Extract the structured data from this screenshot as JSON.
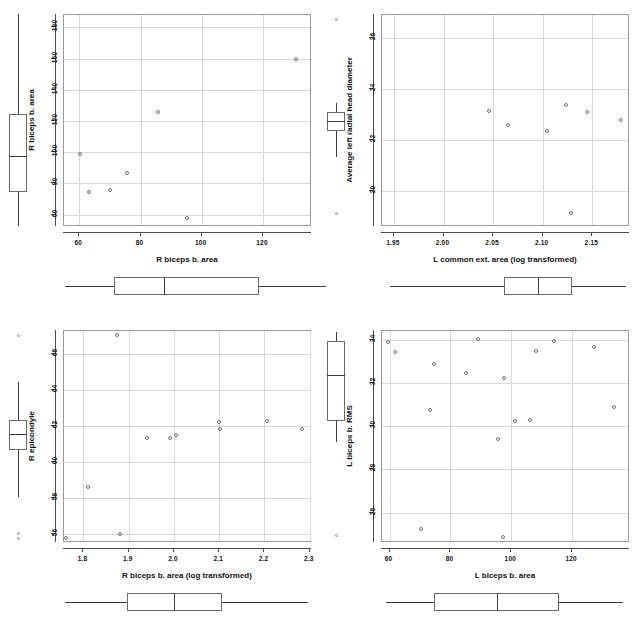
{
  "figure": {
    "title": "",
    "panel_count": 4,
    "marker": "open-circle"
  },
  "chart_data": [
    {
      "type": "scatter",
      "id": "panel-top-left",
      "title": "",
      "xlabel": "R biceps b. area",
      "ylabel": "R biceps b. area",
      "xticks": [
        "60",
        "80",
        "100",
        "120"
      ],
      "xtickvals": [
        60,
        80,
        100,
        120
      ],
      "yticks": [
        "60",
        "80",
        "100",
        "120",
        "140",
        "160",
        "180"
      ],
      "ytickvals": [
        60,
        80,
        100,
        120,
        140,
        160,
        180
      ],
      "xlim": [
        55,
        136
      ],
      "ylim": [
        52,
        188
      ],
      "grid": true,
      "legend": "none",
      "points": [
        {
          "x": 60.5,
          "y": 98
        },
        {
          "x": 63.5,
          "y": 74
        },
        {
          "x": 70.5,
          "y": 75
        },
        {
          "x": 76.0,
          "y": 86
        },
        {
          "x": 86.0,
          "y": 125
        },
        {
          "x": 95.5,
          "y": 57
        },
        {
          "x": 131.0,
          "y": 159
        }
      ],
      "xbox": {
        "min": 55.5,
        "q1": 71.5,
        "median": 88.0,
        "q3": 119.0,
        "max": 141.0,
        "outliers": []
      },
      "ybox": {
        "min": 52.0,
        "q1": 74.0,
        "median": 97.0,
        "q3": 124.0,
        "max": 188.0,
        "outliers": []
      }
    },
    {
      "type": "scatter",
      "id": "panel-top-right",
      "title": "",
      "xlabel": "L common ext. area (log transformed)",
      "ylabel": "Average left radial head diameter",
      "xticks": [
        "1.95",
        "2.00",
        "2.05",
        "2.10",
        "2.15"
      ],
      "xtickvals": [
        1.95,
        2.0,
        2.05,
        2.1,
        2.15
      ],
      "yticks": [
        "20",
        "22",
        "24",
        "26"
      ],
      "ytickvals": [
        20,
        22,
        24,
        26
      ],
      "xlim": [
        1.938,
        2.188
      ],
      "ylim": [
        18.6,
        26.9
      ],
      "grid": true,
      "legend": "none",
      "points": [
        {
          "x": 2.0465,
          "y": 23.1
        },
        {
          "x": 2.0665,
          "y": 22.55
        },
        {
          "x": 2.1055,
          "y": 22.3
        },
        {
          "x": 2.1245,
          "y": 23.35
        },
        {
          "x": 2.1295,
          "y": 19.1
        },
        {
          "x": 2.1455,
          "y": 23.05
        },
        {
          "x": 2.1795,
          "y": 22.75
        }
      ],
      "xbox": {
        "min": 1.947,
        "q1": 2.0615,
        "median": 2.0965,
        "q3": 2.1305,
        "max": 2.1845,
        "outliers": []
      },
      "ybox": {
        "min": 21.3,
        "q1": 22.3,
        "median": 22.7,
        "q3": 23.05,
        "max": 23.4,
        "outliers": [
          26.7,
          19.1
        ]
      }
    },
    {
      "type": "scatter",
      "id": "panel-bottom-left",
      "title": "",
      "xlabel": "R biceps b. area (log transformed)",
      "ylabel": "R epicondyle",
      "xticks": [
        "1.8",
        "1.9",
        "2.0",
        "2.1",
        "2.2",
        "2.3"
      ],
      "xtickvals": [
        1.8,
        1.9,
        2.0,
        2.1,
        2.2,
        2.3
      ],
      "yticks": [
        "56",
        "58",
        "60",
        "62",
        "64",
        "66"
      ],
      "ytickvals": [
        56,
        58,
        60,
        62,
        64,
        66
      ],
      "xlim": [
        1.757,
        2.305
      ],
      "ylim": [
        55.5,
        67.3
      ],
      "grid": true,
      "legend": "none",
      "points": [
        {
          "x": 1.763,
          "y": 55.7
        },
        {
          "x": 1.813,
          "y": 58.55
        },
        {
          "x": 1.877,
          "y": 67.0
        },
        {
          "x": 1.883,
          "y": 55.95
        },
        {
          "x": 1.943,
          "y": 61.3
        },
        {
          "x": 1.993,
          "y": 61.3
        },
        {
          "x": 2.006,
          "y": 61.45
        },
        {
          "x": 2.101,
          "y": 62.2
        },
        {
          "x": 2.104,
          "y": 61.8
        },
        {
          "x": 2.207,
          "y": 62.25
        },
        {
          "x": 2.285,
          "y": 61.8
        }
      ],
      "xbox": {
        "min": 1.762,
        "q1": 1.898,
        "median": 2.002,
        "q3": 2.108,
        "max": 2.298,
        "outliers": []
      },
      "ybox": {
        "min": 58.0,
        "q1": 60.6,
        "median": 61.5,
        "q3": 62.3,
        "max": 64.4,
        "outliers": [
          67.0,
          56.0,
          55.7
        ]
      }
    },
    {
      "type": "scatter",
      "id": "panel-bottom-right",
      "title": "",
      "xlabel": "L biceps b. area",
      "ylabel": "L biceps b. RMS",
      "xticks": [
        "60",
        "80",
        "100",
        "120"
      ],
      "xtickvals": [
        60,
        80,
        100,
        120
      ],
      "yticks": [
        "26",
        "28",
        "30",
        "32",
        "34"
      ],
      "ytickvals": [
        26,
        28,
        30,
        32,
        34
      ],
      "xlim": [
        57.5,
        139.0
      ],
      "ylim": [
        24.6,
        34.4
      ],
      "grid": true,
      "legend": "none",
      "points": [
        {
          "x": 59.8,
          "y": 33.85
        },
        {
          "x": 62.0,
          "y": 33.4
        },
        {
          "x": 70.5,
          "y": 25.2
        },
        {
          "x": 75.0,
          "y": 32.85
        },
        {
          "x": 73.5,
          "y": 30.7
        },
        {
          "x": 85.5,
          "y": 32.4
        },
        {
          "x": 89.5,
          "y": 34.0
        },
        {
          "x": 96.0,
          "y": 29.35
        },
        {
          "x": 97.5,
          "y": 24.85
        },
        {
          "x": 98.0,
          "y": 32.2
        },
        {
          "x": 101.5,
          "y": 30.2
        },
        {
          "x": 106.5,
          "y": 30.25
        },
        {
          "x": 108.5,
          "y": 33.45
        },
        {
          "x": 114.5,
          "y": 33.9
        },
        {
          "x": 127.5,
          "y": 33.6
        },
        {
          "x": 134.0,
          "y": 30.85
        }
      ],
      "xbox": {
        "min": 59.0,
        "q1": 75.0,
        "median": 95.5,
        "q3": 116.0,
        "max": 137.0,
        "outliers": []
      },
      "ybox": {
        "min": 29.2,
        "q1": 30.2,
        "median": 32.3,
        "q3": 33.9,
        "max": 34.3,
        "outliers": [
          24.9
        ]
      }
    }
  ]
}
